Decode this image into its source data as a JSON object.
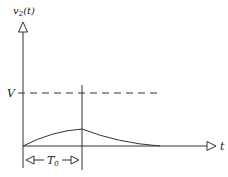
{
  "diagram": {
    "y_axis_label": "v",
    "y_axis_sub": "2",
    "y_axis_suffix": "(t)",
    "x_axis_label": "t",
    "level_label": "V",
    "interval_label": "T",
    "interval_sub": "0",
    "colors": {
      "stroke": "#333333",
      "background": "#ffffff"
    }
  }
}
